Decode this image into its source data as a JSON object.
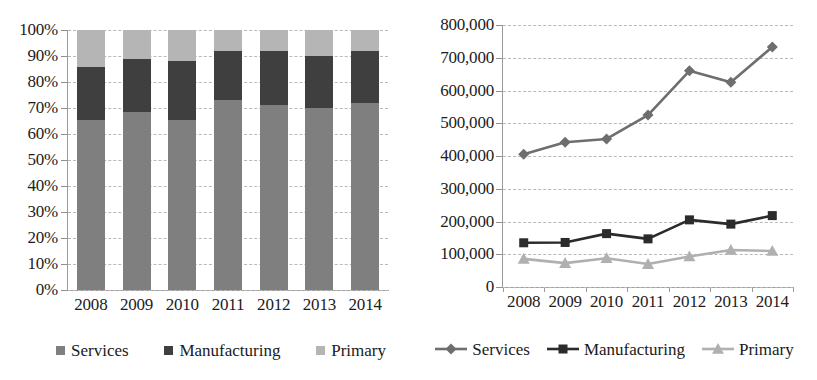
{
  "figure": {
    "panels": [
      "stacked-share-chart",
      "absolute-value-line-chart"
    ]
  },
  "left_chart": {
    "y_axis": {
      "ticks": [
        "100%",
        "90%",
        "80%",
        "70%",
        "60%",
        "50%",
        "40%",
        "30%",
        "20%",
        "10%",
        "0%"
      ]
    },
    "x_axis": {
      "ticks": [
        "2008",
        "2009",
        "2010",
        "2011",
        "2012",
        "2013",
        "2014"
      ]
    },
    "legend": [
      {
        "label": "Services",
        "color": "#7f7f7f",
        "marker": "square-swatch"
      },
      {
        "label": "Manufacturing",
        "color": "#3f3f3f",
        "marker": "square-swatch"
      },
      {
        "label": "Primary",
        "color": "#b5b5b5",
        "marker": "square-swatch"
      }
    ]
  },
  "right_chart": {
    "y_axis": {
      "ticks": [
        "800,000",
        "700,000",
        "600,000",
        "500,000",
        "400,000",
        "300,000",
        "200,000",
        "100,000",
        "0"
      ]
    },
    "x_axis": {
      "ticks": [
        "2008",
        "2009",
        "2010",
        "2011",
        "2012",
        "2013",
        "2014"
      ]
    },
    "legend": [
      {
        "label": "Services",
        "color": "#6e6e6e",
        "marker": "diamond"
      },
      {
        "label": "Manufacturing",
        "color": "#2b2b2b",
        "marker": "square"
      },
      {
        "label": "Primary",
        "color": "#b0b0b0",
        "marker": "triangle"
      }
    ]
  },
  "chart_data": [
    {
      "type": "bar",
      "subtype": "stacked-100-percent",
      "title": "",
      "xlabel": "",
      "ylabel": "",
      "categories": [
        "2008",
        "2009",
        "2010",
        "2011",
        "2012",
        "2013",
        "2014"
      ],
      "ylim": [
        0,
        100
      ],
      "ytick_values": [
        0,
        10,
        20,
        30,
        40,
        50,
        60,
        70,
        80,
        90,
        100
      ],
      "ytick_labels": [
        "0%",
        "10%",
        "20%",
        "30%",
        "40%",
        "50%",
        "60%",
        "70%",
        "80%",
        "90%",
        "100%"
      ],
      "grid": true,
      "grid_style": "dashed-horizontal",
      "legend_position": "bottom",
      "series": [
        {
          "name": "Services",
          "color": "#7f7f7f",
          "values": [
            65.4,
            68.5,
            65.4,
            73.0,
            71.0,
            70.0,
            72.0
          ]
        },
        {
          "name": "Manufacturing",
          "color": "#3f3f3f",
          "values": [
            20.4,
            20.5,
            22.6,
            19.0,
            21.0,
            20.0,
            20.0
          ]
        },
        {
          "name": "Primary",
          "color": "#b5b5b5",
          "values": [
            14.2,
            11.0,
            12.0,
            8.0,
            8.0,
            10.0,
            8.0
          ]
        }
      ]
    },
    {
      "type": "line",
      "subtype": "marker-line",
      "title": "",
      "xlabel": "",
      "ylabel": "",
      "x": [
        "2008",
        "2009",
        "2010",
        "2011",
        "2012",
        "2013",
        "2014"
      ],
      "ylim": [
        0,
        800000
      ],
      "ytick_values": [
        0,
        100000,
        200000,
        300000,
        400000,
        500000,
        600000,
        700000,
        800000
      ],
      "ytick_labels": [
        "0",
        "100,000",
        "200,000",
        "300,000",
        "400,000",
        "500,000",
        "600,000",
        "700,000",
        "800,000"
      ],
      "grid": true,
      "grid_style": "dashed-horizontal",
      "legend_position": "bottom",
      "series": [
        {
          "name": "Services",
          "color": "#6e6e6e",
          "marker": "diamond",
          "values": [
            405000,
            442000,
            452000,
            525000,
            660000,
            625000,
            733000
          ]
        },
        {
          "name": "Manufacturing",
          "color": "#2b2b2b",
          "marker": "square",
          "values": [
            135000,
            136000,
            163000,
            147000,
            205000,
            192000,
            218000
          ]
        },
        {
          "name": "Primary",
          "color": "#b0b0b0",
          "marker": "triangle",
          "values": [
            86000,
            73000,
            88000,
            70000,
            93000,
            113000,
            110000
          ]
        }
      ]
    }
  ]
}
